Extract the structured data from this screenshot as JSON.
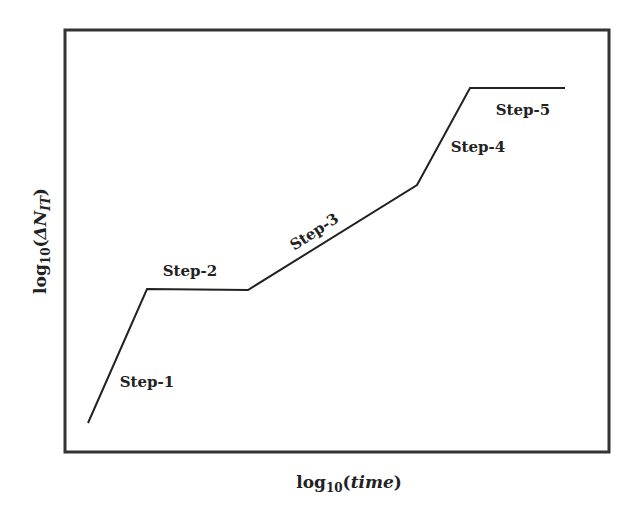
{
  "chart_data": {
    "type": "line",
    "title": "",
    "xlabel": "log10(time)",
    "ylabel": "log10(ΔN_IT)",
    "x_axis": {
      "base": "log",
      "sub": "10",
      "arg": "time"
    },
    "y_axis": {
      "base": "log",
      "sub": "10",
      "arg_prefix": "ΔN",
      "arg_sub": "IT"
    },
    "grid": false,
    "legend": "none",
    "ticks": "none",
    "series": [
      {
        "name": "ΔN_IT degradation",
        "points_px": [
          [
            88,
            423
          ],
          [
            147,
            289
          ],
          [
            248,
            290
          ],
          [
            417,
            185
          ],
          [
            470,
            88
          ],
          [
            565,
            88
          ]
        ],
        "points_normalized": [
          [
            0.04,
            0.07
          ],
          [
            0.15,
            0.38
          ],
          [
            0.34,
            0.38
          ],
          [
            0.65,
            0.63
          ],
          [
            0.75,
            0.86
          ],
          [
            0.92,
            0.86
          ]
        ]
      }
    ],
    "annotations": [
      {
        "text": "Step-1",
        "x": 147,
        "y": 387,
        "rotate": 0
      },
      {
        "text": "Step-2",
        "x": 190,
        "y": 276,
        "rotate": 0
      },
      {
        "text": "Step-3",
        "x": 317,
        "y": 236,
        "rotate": -33
      },
      {
        "text": "Step-4",
        "x": 478,
        "y": 152,
        "rotate": 0
      },
      {
        "text": "Step-5",
        "x": 523,
        "y": 115,
        "rotate": 0
      }
    ],
    "frame": {
      "left": 65,
      "top": 30,
      "right": 609,
      "bottom": 452
    }
  },
  "colors": {
    "line": "#222222",
    "frame": "#333333",
    "text": "#222222"
  }
}
